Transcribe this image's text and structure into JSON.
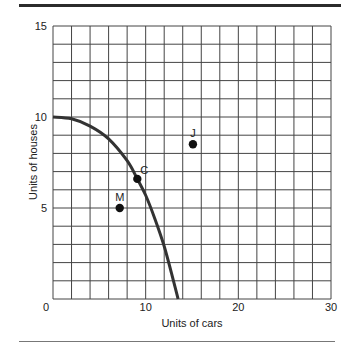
{
  "chart_data": {
    "type": "line",
    "title": "",
    "xlabel": "Units of cars",
    "ylabel": "Units of houses",
    "xlim": [
      0,
      30
    ],
    "ylim": [
      0,
      15
    ],
    "x_ticks": [
      "0",
      "10",
      "20",
      "30"
    ],
    "y_ticks": [
      "5",
      "10",
      "15"
    ],
    "grid": true,
    "grid_x_step": 2,
    "grid_y_step": 1,
    "series": [
      {
        "name": "Production possibilities frontier",
        "type": "line",
        "x": [
          0,
          2,
          4,
          6,
          8,
          9.1,
          10,
          11,
          12,
          13,
          13.5
        ],
        "y": [
          10,
          9.9,
          9.5,
          8.8,
          7.6,
          6.6,
          5.7,
          4.4,
          2.9,
          1.0,
          0
        ]
      }
    ],
    "points": [
      {
        "label": "C",
        "x": 9.1,
        "y": 6.6
      },
      {
        "label": "M",
        "x": 7.2,
        "y": 5.0
      },
      {
        "label": "J",
        "x": 15.1,
        "y": 8.5
      }
    ],
    "legend": null
  }
}
